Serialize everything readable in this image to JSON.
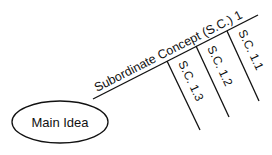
{
  "diagram": {
    "type": "spider-map",
    "main_idea": {
      "label": "Main Idea"
    },
    "subordinate_concept": {
      "label": "Subordinate Concept (S.C.) 1"
    },
    "sub_branches": [
      {
        "label": "S.C. 1.1"
      },
      {
        "label": "S.C. 1.2"
      },
      {
        "label": "S.C. 1.3"
      }
    ],
    "colors": {
      "stroke": "#111111",
      "background": "#ffffff",
      "text": "#111111"
    }
  }
}
